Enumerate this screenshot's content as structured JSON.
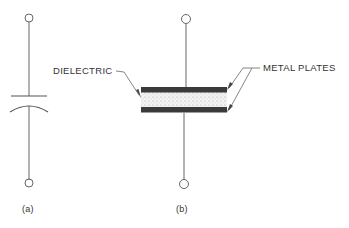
{
  "figure": {
    "panel_a": {
      "caption": "(a)",
      "description": "Capacitor schematic symbol"
    },
    "panel_b": {
      "caption": "(b)",
      "description": "Capacitor construction",
      "labels": {
        "dielectric": "DIELECTRIC",
        "metal_plates": "METAL PLATES"
      }
    },
    "colors": {
      "line": "#555555",
      "plate": "#3a3a3a",
      "dielectric_fill": "#ececec",
      "text": "#333333"
    }
  }
}
